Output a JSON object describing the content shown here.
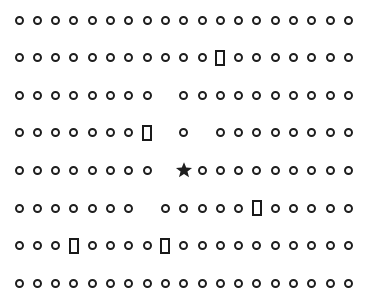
{
  "canvas": {
    "width": 369,
    "height": 301,
    "background": "#ffffff",
    "ink": "#1e1e1e"
  },
  "grid": {
    "rows": 8,
    "cols": 19,
    "origin_x": 19,
    "origin_y": 20,
    "col_spacing": 18.3,
    "row_spacing": 37.6,
    "legend": {
      "o": "circle",
      "R": "rectangle",
      "*": "star",
      ".": "empty"
    },
    "layout": [
      "ooooooooooooooooooo",
      "oooooooooooRooooooo",
      "oooooooo.oooooooooo",
      "oooooooR.o.oooooooo",
      "oooooooo.*ooooooooo",
      "ooooooo.oooooRooooo",
      "oooRooooRoooooooooo",
      "ooooooooooooooooooo"
    ]
  },
  "targets": {
    "star": {
      "row": 5,
      "col": 10
    },
    "rectangles": [
      {
        "row": 2,
        "col": 12
      },
      {
        "row": 4,
        "col": 8
      },
      {
        "row": 6,
        "col": 14
      },
      {
        "row": 7,
        "col": 4
      },
      {
        "row": 7,
        "col": 9
      }
    ]
  }
}
